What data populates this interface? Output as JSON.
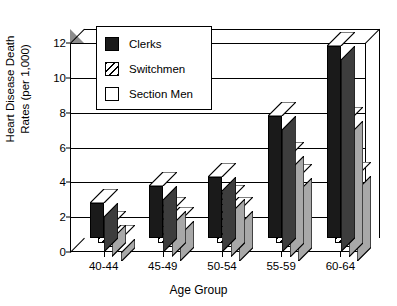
{
  "chart_data": {
    "type": "bar",
    "title": "",
    "subtitle": "",
    "xlabel": "Age Group",
    "ylabel": "Heart Disease Death Rates (per 1,000)",
    "ylabel_line1": "Heart Disease Death",
    "ylabel_line2": "Rates (per 1,000)",
    "categories": [
      "40-44",
      "45-49",
      "50-54",
      "55-59",
      "60-64"
    ],
    "series": [
      {
        "name": "Clerks",
        "values": [
          2.0,
          3.0,
          3.5,
          7.0,
          11.0
        ],
        "color": "#1a1a1a",
        "pattern": "solid-black"
      },
      {
        "name": "Switchmen",
        "values": [
          1.0,
          1.8,
          2.5,
          5.0,
          7.0
        ],
        "color": "#ffffff",
        "pattern": "diagonal-hatch"
      },
      {
        "name": "Section Men",
        "values": [
          0.5,
          1.5,
          2.1,
          4.0,
          4.1
        ],
        "color": "#ffffff",
        "pattern": "open-white"
      }
    ],
    "ylim": [
      0,
      12
    ],
    "yticks": [
      0,
      2,
      4,
      6,
      8,
      10,
      12
    ],
    "ytick_labels": [
      "0",
      "2",
      "4",
      "6",
      "8",
      "10",
      "12"
    ],
    "grid": true,
    "grid_axis": "y",
    "legend_position": "upper-left-inside",
    "style": "3d-bar-chart-grayscale",
    "axis_color": "#000000",
    "background": "#ffffff"
  },
  "legend": {
    "entries": [
      {
        "label": "Clerks"
      },
      {
        "label": "Switchmen"
      },
      {
        "label": "Section Men"
      }
    ]
  }
}
